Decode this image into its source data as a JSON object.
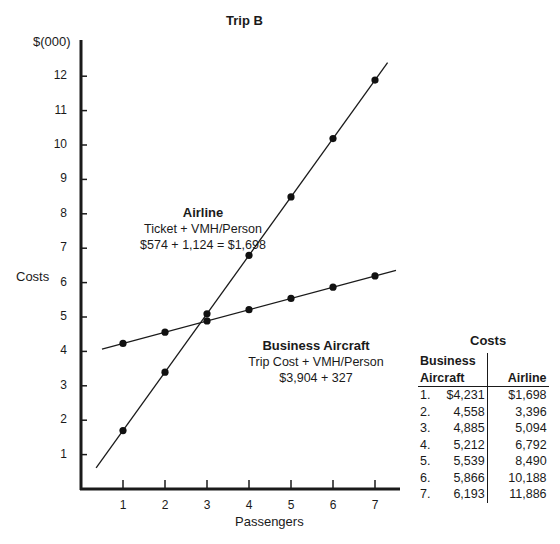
{
  "chart_data": {
    "type": "line",
    "title": "Trip B",
    "xlabel": "Passengers",
    "ylabel": "Costs",
    "yunit": "$(000)",
    "x": [
      1,
      2,
      3,
      4,
      5,
      6,
      7
    ],
    "xticks": [
      "1",
      "2",
      "3",
      "4",
      "5",
      "6",
      "7"
    ],
    "yticks": [
      "1",
      "2",
      "3",
      "4",
      "5",
      "6",
      "7",
      "8",
      "9",
      "10",
      "11",
      "12"
    ],
    "ylim": [
      0,
      12.6
    ],
    "xlim": [
      0,
      7.5
    ],
    "grid": false,
    "series": [
      {
        "name": "Airline",
        "values": [
          1.698,
          3.396,
          5.094,
          6.792,
          8.49,
          10.188,
          11.886
        ]
      },
      {
        "name": "Business Aircraft",
        "values": [
          4.231,
          4.558,
          4.885,
          5.212,
          5.539,
          5.866,
          6.193
        ]
      }
    ],
    "annotations": [
      {
        "title": "Airline",
        "line1": "Ticket + VMH/Person",
        "line2": "$574 + 1,124 = $1,698"
      },
      {
        "title": "Business Aircraft",
        "line1": "Trip Cost + VMH/Person",
        "line2": "$3,904 + 327"
      }
    ]
  },
  "table": {
    "title": "Costs",
    "header_col1_line1": "Business",
    "header_col1_line2": "Aircraft",
    "header_col2": "Airline",
    "rows": [
      {
        "n": "1.",
        "business": "$4,231",
        "airline": "$1,698"
      },
      {
        "n": "2.",
        "business": "4,558",
        "airline": "3,396"
      },
      {
        "n": "3.",
        "business": "4,885",
        "airline": "5,094"
      },
      {
        "n": "4.",
        "business": "5,212",
        "airline": "6,792"
      },
      {
        "n": "5.",
        "business": "5,539",
        "airline": "8,490"
      },
      {
        "n": "6.",
        "business": "5,866",
        "airline": "10,188"
      },
      {
        "n": "7.",
        "business": "6,193",
        "airline": "11,886"
      }
    ]
  }
}
